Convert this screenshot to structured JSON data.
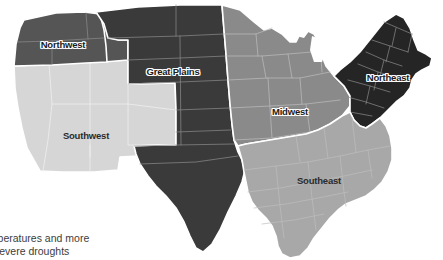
{
  "figure": {
    "kind": "choropleth-region-map",
    "background_color": "#ffffff",
    "boundary_color": "#ffffff"
  },
  "regions": [
    {
      "id": "northwest",
      "label": "Northwest",
      "fill": "#555555",
      "label_style": "outlined",
      "label_x": 63,
      "label_y": 45
    },
    {
      "id": "great-plains",
      "label": "Great Plains",
      "fill": "#3a3a3a",
      "label_style": "outlined",
      "label_x": 173,
      "label_y": 72
    },
    {
      "id": "southwest",
      "label": "Southwest",
      "fill": "#d6d6d6",
      "label_style": "plain",
      "label_x": 86,
      "label_y": 136
    },
    {
      "id": "midwest",
      "label": "Midwest",
      "fill": "#8a8a8a",
      "label_style": "outlined",
      "label_x": 290,
      "label_y": 112
    },
    {
      "id": "northeast",
      "label": "Northeast",
      "fill": "#252525",
      "label_style": "outlined",
      "label_x": 388,
      "label_y": 78
    },
    {
      "id": "southeast",
      "label": "Southeast",
      "fill": "#a8a8a8",
      "label_style": "plain",
      "label_x": 319,
      "label_y": 181
    }
  ],
  "caption": {
    "heading": "st",
    "line_1": "emperatures and more",
    "line_2": "severe droughts",
    "heading_color": "#9a9a9a",
    "text_color": "#3d3d3d"
  }
}
